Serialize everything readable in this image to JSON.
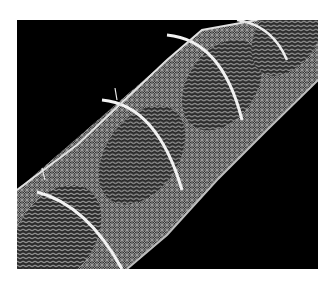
{
  "image": {
    "subject": "SEM micrograph of segmented structure (diagonal, textured segments)",
    "background_color": "#000000",
    "frame_color": "#ffffff"
  }
}
